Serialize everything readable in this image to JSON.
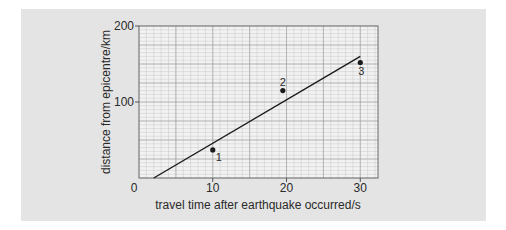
{
  "chart_data": {
    "type": "scatter",
    "title": "",
    "xlabel": "travel time after earthquake occurred/s",
    "ylabel": "distance from epicentre/km",
    "xlim": [
      0,
      32.4
    ],
    "ylim": [
      0,
      200
    ],
    "x_ticks": [
      0,
      10,
      20,
      30
    ],
    "y_ticks": [
      0,
      100,
      200
    ],
    "x_tick_labels": [
      "0",
      "10",
      "20",
      "30"
    ],
    "y_tick_labels": [
      "100",
      "200"
    ],
    "origin_label": "0",
    "grid": true,
    "legend": null,
    "points": [
      {
        "label": "1",
        "x": 10,
        "y": 37
      },
      {
        "label": "2",
        "x": 19.5,
        "y": 115
      },
      {
        "label": "3",
        "x": 30,
        "y": 152
      }
    ],
    "fit_line": {
      "x0": 2,
      "y0": 0,
      "x1": 30,
      "y1": 160
    }
  },
  "colors": {
    "panel": "#e4e4e4",
    "plot_bg": "#f2f2f2",
    "grid_minor": "#c9c9c9",
    "grid_major": "#9a9a9a",
    "ink": "#1a1a1a"
  }
}
